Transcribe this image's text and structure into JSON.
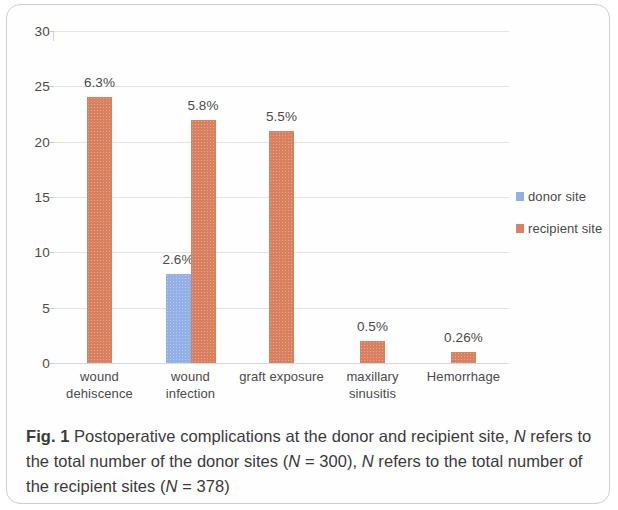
{
  "figure": {
    "label": "Fig. 1",
    "caption_text": "Postoperative complications at the donor and recipient site, N refers to the total number of the donor sites (N = 300), N refers to the total number of the recipient sites (N = 378)",
    "caption_part1": "Postoperative complications at the donor and recipient site, ",
    "caption_n1": "N",
    "caption_part2": " refers to the total number of the donor sites (",
    "caption_n2": "N",
    "caption_part3": " = 300), ",
    "caption_n3": "N",
    "caption_part4": " refers to the total number of the recipient sites (",
    "caption_n4": "N",
    "caption_part5": " = 378)"
  },
  "legend": {
    "position": "right",
    "items": [
      {
        "label": "donor site",
        "color": "#93b0e6"
      },
      {
        "label": "recipient site",
        "color": "#d9805f"
      }
    ]
  },
  "chart_data": {
    "type": "bar",
    "title": "",
    "subtitle": "",
    "xlabel": "",
    "ylabel": "",
    "ylim": [
      0,
      30
    ],
    "yticks": [
      0,
      5,
      10,
      15,
      20,
      25,
      30
    ],
    "ytick_labels": [
      "0",
      "5",
      "10",
      "15",
      "20",
      "25",
      "30"
    ],
    "grid": true,
    "grid_axis": "y",
    "legend_position": "right",
    "categories": [
      "wound\ndehiscence",
      "wound\ninfection",
      "graft exposure",
      "maxillary\nsinusitis",
      "Hemorrhage"
    ],
    "category_labels_flat": [
      "wound dehiscence",
      "wound infection",
      "graft exposure",
      "maxillary sinusitis",
      "Hemorrhage"
    ],
    "series": [
      {
        "name": "donor site",
        "color": "#93b0e6",
        "values": [
          null,
          8,
          null,
          null,
          null
        ],
        "data_labels": [
          null,
          "2.6%",
          null,
          null,
          null
        ]
      },
      {
        "name": "recipient site",
        "color": "#d9805f",
        "values": [
          24,
          22,
          21,
          2,
          1
        ],
        "data_labels": [
          "6.3%",
          "5.8%",
          "5.5%",
          "0.5%",
          "0.26%"
        ]
      }
    ],
    "annotations": [
      {
        "text": "6.3%",
        "category": "wound dehiscence",
        "series": "recipient site"
      },
      {
        "text": "5.8%",
        "category": "wound infection",
        "series": "recipient site"
      },
      {
        "text": "2.6%",
        "category": "wound infection",
        "series": "donor site"
      },
      {
        "text": "5.5%",
        "category": "graft exposure",
        "series": "recipient site"
      },
      {
        "text": "0.5%",
        "category": "maxillary sinusitis",
        "series": "recipient site"
      },
      {
        "text": "0.26%",
        "category": "Hemorrhage",
        "series": "recipient site"
      }
    ]
  }
}
